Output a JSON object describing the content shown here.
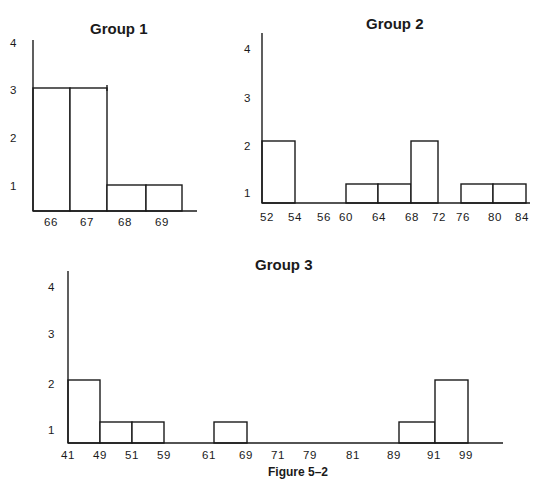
{
  "caption": "Figure 5–2",
  "chart_data": [
    {
      "type": "bar",
      "title": "Group 1",
      "xlabel": "",
      "ylabel": "",
      "ylim": [
        0,
        4
      ],
      "y_ticks": [
        "1",
        "2",
        "3",
        "4"
      ],
      "x_ticks": [
        "66",
        "67",
        "68",
        "69"
      ],
      "categories": [
        "66",
        "67",
        "68",
        "69"
      ],
      "values": [
        3,
        3,
        1,
        1
      ],
      "grid": false
    },
    {
      "type": "bar",
      "title": "Group 2",
      "xlabel": "",
      "ylabel": "",
      "ylim": [
        0,
        4
      ],
      "y_ticks": [
        "1",
        "2",
        "3",
        "4"
      ],
      "x_ticks": [
        "52",
        "54",
        "56",
        "60",
        "64",
        "68",
        "72",
        "76",
        "80",
        "84"
      ],
      "categories": [
        "52-54",
        "54-56",
        "56-60",
        "60-64",
        "64-68",
        "68-72",
        "72-76",
        "76-80",
        "80-84"
      ],
      "values": [
        2,
        0,
        0,
        1,
        1,
        2,
        0,
        1,
        1
      ],
      "grid": false
    },
    {
      "type": "bar",
      "title": "Group 3",
      "xlabel": "",
      "ylabel": "",
      "ylim": [
        0,
        4
      ],
      "y_ticks": [
        "1",
        "2",
        "3",
        "4"
      ],
      "x_ticks": [
        "41",
        "49",
        "51",
        "59",
        "61",
        "69",
        "71",
        "79",
        "81",
        "89",
        "91",
        "99"
      ],
      "categories": [
        "41-49",
        "49-51",
        "51-59",
        "59-61",
        "61-69",
        "69-71",
        "71-79",
        "79-81",
        "81-89",
        "89-91",
        "91-99"
      ],
      "values": [
        2,
        1,
        1,
        0,
        1,
        0,
        0,
        0,
        0,
        1,
        2
      ],
      "grid": false
    }
  ]
}
